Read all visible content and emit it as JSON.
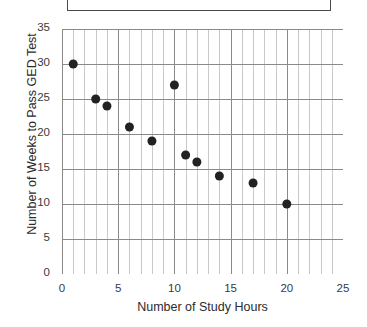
{
  "chart_data": {
    "type": "scatter",
    "title": "",
    "xlabel": "Number of Study Hours",
    "ylabel": "Number of Weeks to Pass GED Test",
    "xlim": [
      0,
      25
    ],
    "ylim": [
      0,
      35
    ],
    "xticks": [
      "0",
      "5",
      "10",
      "15",
      "20",
      "25"
    ],
    "yticks": [
      "0",
      "5",
      "10",
      "15",
      "20",
      "25",
      "30",
      "35"
    ],
    "xtick_step": 5,
    "ytick_step": 5,
    "x_minor_step": 1,
    "grid": true,
    "grid_major_color": "#8a8a8a",
    "grid_minor_color": "#c9c9c9",
    "legend": "none",
    "marker_color": "#222222",
    "marker_size": 9,
    "points": [
      {
        "x": 1,
        "y": 30
      },
      {
        "x": 3,
        "y": 25
      },
      {
        "x": 4,
        "y": 24
      },
      {
        "x": 6,
        "y": 21
      },
      {
        "x": 8,
        "y": 19
      },
      {
        "x": 10,
        "y": 27
      },
      {
        "x": 11,
        "y": 17
      },
      {
        "x": 12,
        "y": 16
      },
      {
        "x": 14,
        "y": 14
      },
      {
        "x": 17,
        "y": 13
      },
      {
        "x": 20,
        "y": 10
      }
    ]
  },
  "title_box": {
    "text": ""
  }
}
